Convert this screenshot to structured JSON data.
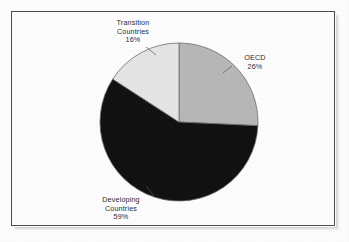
{
  "chart_data": {
    "type": "pie",
    "title": "",
    "subtitle": "",
    "xlabel": "",
    "ylabel": "",
    "legend_position": "none",
    "grid": false,
    "labels_outside": true,
    "start_angle_deg": 0,
    "direction": "clockwise",
    "categories": [
      "OECD",
      "Developing Countries",
      "Transition Countries"
    ],
    "values": [
      26,
      59,
      16
    ],
    "unit": "%",
    "slices": [
      {
        "name": "OECD",
        "value": 26,
        "value_label": "26%",
        "color": "#b9b9b9",
        "start_deg": 0,
        "end_deg": 93.6
      },
      {
        "name": "Developing Countries",
        "value": 59,
        "value_label": "59%",
        "color": "#121212",
        "start_deg": 93.6,
        "end_deg": 306.0
      },
      {
        "name": "Transition Countries",
        "value": 16,
        "value_label": "16%",
        "color": "#e7e7e7",
        "start_deg": 306.0,
        "end_deg": 360.0
      }
    ]
  },
  "labels": {
    "transition": {
      "line1": "Transition",
      "line2": "Countries",
      "percent": "16%"
    },
    "oecd": {
      "line1": "OECD",
      "percent": "26%"
    },
    "developing": {
      "line1": "Developing",
      "line2": "Countries",
      "percent": "59%"
    }
  },
  "style": {
    "background": "#ffffff",
    "frame_color": "#4a4d52",
    "text_color": "#2b2d31",
    "slice_outline": "#6e6e6e"
  }
}
